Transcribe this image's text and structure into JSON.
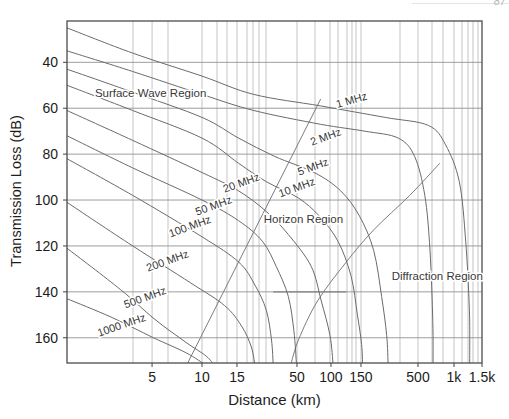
{
  "page": {
    "corner_fragment": "87"
  },
  "chart_data": {
    "type": "line",
    "title": "",
    "xlabel": "Distance (km)",
    "ylabel": "Transmission Loss (dB)",
    "grid": true,
    "legend": "none (curves labeled inline)",
    "x_scale": "log",
    "x_range_km": [
      1.5,
      1500
    ],
    "y_range_db": [
      22,
      171
    ],
    "y_axis_inverted": true,
    "y_ticks": [
      40,
      60,
      80,
      100,
      120,
      140,
      160
    ],
    "x_ticks": [
      {
        "km": 5,
        "label": "5",
        "frac": 0.205
      },
      {
        "km": 10,
        "label": "10",
        "frac": 0.3253
      },
      {
        "km": 15,
        "label": "15",
        "frac": 0.4096
      },
      {
        "km": 50,
        "label": "50",
        "frac": 0.5542
      },
      {
        "km": 100,
        "label": "100",
        "frac": 0.6361
      },
      {
        "km": 150,
        "label": "150",
        "frac": 0.7084
      },
      {
        "km": 500,
        "label": "500",
        "frac": 0.8458
      },
      {
        "km": 1000,
        "label": "1k",
        "frac": 0.9325
      },
      {
        "km": 1500,
        "label": "1.5k",
        "frac": 1.0
      }
    ],
    "x_anchor_fracs": [
      [
        1.5,
        0.0
      ],
      [
        5,
        0.205
      ],
      [
        10,
        0.3253
      ],
      [
        15,
        0.4096
      ],
      [
        50,
        0.5542
      ],
      [
        100,
        0.6361
      ],
      [
        150,
        0.7084
      ],
      [
        500,
        0.8458
      ],
      [
        1000,
        0.9325
      ],
      [
        1500,
        1.0
      ]
    ],
    "x_gridlines_frac": [
      0.159,
      0.205,
      0.2434,
      0.3253,
      0.3614,
      0.3855,
      0.4096,
      0.4337,
      0.4482,
      0.4627,
      0.4795,
      0.5542,
      0.5976,
      0.6337,
      0.653,
      0.6747,
      0.6867,
      0.6964,
      0.7084,
      0.8024,
      0.8458,
      0.8795,
      0.906,
      0.9325,
      0.9518,
      0.9663,
      0.9783,
      0.9904
    ],
    "series": [
      {
        "name": "1 MHz",
        "points": [
          [
            1.5,
            25
          ],
          [
            3.8,
            36
          ],
          [
            10,
            46
          ],
          [
            21,
            54
          ],
          [
            81,
            59
          ],
          [
            250,
            64
          ],
          [
            610,
            67.5
          ],
          [
            850,
            76
          ],
          [
            1080,
            92
          ],
          [
            1185,
            118
          ],
          [
            1250,
            148
          ],
          [
            1255,
            172
          ]
        ]
      },
      {
        "name": "2 MHz",
        "points": [
          [
            1.5,
            35
          ],
          [
            3.8,
            44
          ],
          [
            10,
            54
          ],
          [
            21,
            61
          ],
          [
            81,
            67
          ],
          [
            163,
            70
          ],
          [
            330,
            73
          ],
          [
            465,
            81
          ],
          [
            570,
            98
          ],
          [
            630,
            122
          ],
          [
            665,
            153
          ],
          [
            668,
            172
          ]
        ]
      },
      {
        "name": "5 MHz",
        "points": [
          [
            1.5,
            43
          ],
          [
            3.8,
            53
          ],
          [
            10,
            64
          ],
          [
            15.5,
            73
          ],
          [
            32,
            81
          ],
          [
            71,
            88
          ],
          [
            114,
            96
          ],
          [
            147,
            107
          ],
          [
            196,
            122
          ],
          [
            232,
            142
          ],
          [
            258,
            159
          ],
          [
            266,
            172
          ]
        ]
      },
      {
        "name": "10 MHz",
        "points": [
          [
            1.5,
            50
          ],
          [
            3.8,
            61
          ],
          [
            10,
            73
          ],
          [
            15.5,
            84
          ],
          [
            27,
            92
          ],
          [
            51,
            99
          ],
          [
            79,
            107
          ],
          [
            110,
            118
          ],
          [
            131,
            133
          ],
          [
            143,
            150
          ],
          [
            152,
            163
          ],
          [
            155,
            172
          ]
        ]
      },
      {
        "name": "20 MHz",
        "points": [
          [
            1.5,
            61
          ],
          [
            3.8,
            74
          ],
          [
            10,
            88
          ],
          [
            15.5,
            96
          ],
          [
            27,
            105
          ],
          [
            42,
            115
          ],
          [
            67,
            129
          ],
          [
            82,
            144
          ],
          [
            98,
            159
          ],
          [
            103,
            172
          ]
        ]
      },
      {
        "name": "50 MHz",
        "points": [
          [
            1.5,
            72
          ],
          [
            3.8,
            86
          ],
          [
            10,
            100
          ],
          [
            15.5,
            109
          ],
          [
            25,
            118
          ],
          [
            33,
            129
          ],
          [
            42,
            142
          ],
          [
            47,
            157
          ],
          [
            49.5,
            172
          ]
        ]
      },
      {
        "name": "100 MHz",
        "points": [
          [
            1.5,
            82
          ],
          [
            3.8,
            98
          ],
          [
            10,
            116
          ],
          [
            15.5,
            127
          ],
          [
            21.5,
            137
          ],
          [
            27,
            148
          ],
          [
            30,
            161
          ],
          [
            31,
            172
          ]
        ]
      },
      {
        "name": "200 MHz",
        "points": [
          [
            1.5,
            101
          ],
          [
            3.8,
            120
          ],
          [
            8.5,
            136
          ],
          [
            13,
            146
          ],
          [
            16.5,
            155
          ],
          [
            20,
            164
          ],
          [
            21.5,
            172
          ]
        ]
      },
      {
        "name": "500 MHz",
        "points": [
          [
            1.5,
            121
          ],
          [
            3.2,
            139
          ],
          [
            5.2,
            152
          ],
          [
            8,
            162
          ],
          [
            10.5,
            168
          ],
          [
            11.5,
            172
          ]
        ]
      },
      {
        "name": "1000 MHz",
        "points": [
          [
            1.5,
            143
          ],
          [
            2.8,
            151
          ],
          [
            5.1,
            160
          ],
          [
            8,
            166.5
          ],
          [
            10.5,
            172
          ]
        ]
      }
    ],
    "boundaries": [
      {
        "name": "horizon-boundary",
        "points": [
          [
            8.2,
            171
          ],
          [
            81,
            56
          ]
        ]
      },
      {
        "name": "diffraction-boundary",
        "points": [
          [
            760,
            84
          ],
          [
            420,
            98
          ],
          [
            196,
            113
          ],
          [
            123,
            127
          ],
          [
            76,
            144
          ],
          [
            51.5,
            161
          ],
          [
            44,
            172
          ]
        ]
      }
    ],
    "labels": [
      {
        "text": "1 MHz",
        "km": 134,
        "db": 58,
        "rot": -16,
        "kind": "curve"
      },
      {
        "text": "2 MHz",
        "km": 92,
        "db": 74,
        "rot": -20,
        "kind": "curve"
      },
      {
        "text": "5 MHz",
        "km": 71,
        "db": 87,
        "rot": -20,
        "kind": "curve"
      },
      {
        "text": "10 MHz",
        "km": 51,
        "db": 96,
        "rot": -20,
        "kind": "curve"
      },
      {
        "text": "20 MHz",
        "km": 16.8,
        "db": 94,
        "rot": -20,
        "kind": "curve"
      },
      {
        "text": "50 MHz",
        "km": 11.6,
        "db": 104,
        "rot": -20,
        "kind": "curve"
      },
      {
        "text": "100 MHz",
        "km": 8.6,
        "db": 113,
        "rot": -20,
        "kind": "curve"
      },
      {
        "text": "200 MHz",
        "km": 6.3,
        "db": 128,
        "rot": -20,
        "kind": "curve"
      },
      {
        "text": "500 MHz",
        "km": 4.6,
        "db": 144,
        "rot": -20,
        "kind": "curve"
      },
      {
        "text": "1000 MHz",
        "km": 3.3,
        "db": 156,
        "rot": -19,
        "kind": "curve"
      },
      {
        "text": "Surface Wave Region",
        "km": 4.9,
        "db": 55,
        "rot": 0,
        "kind": "region"
      },
      {
        "text": "Horizon Region",
        "km": 57,
        "db": 110,
        "rot": 0,
        "kind": "region"
      },
      {
        "text": "Diffraction Region",
        "km": 725,
        "db": 135,
        "rot": 0,
        "kind": "region"
      }
    ],
    "artifacts": [
      {
        "type": "dark-gridline-segment",
        "db": 140,
        "km_range": [
          31,
          123
        ]
      }
    ]
  }
}
